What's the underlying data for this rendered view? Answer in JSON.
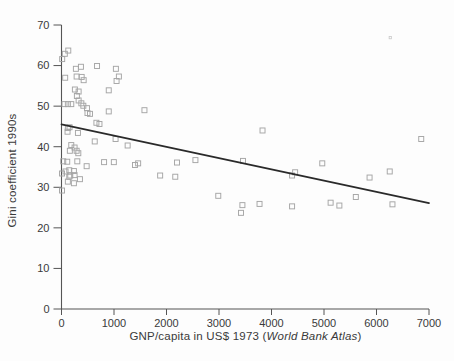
{
  "figure": {
    "background": "#fdfdfd",
    "marker_color": "#a5a5a5",
    "stray_mark_color": "#c8c8c8",
    "trend_line_color": "#2a2a2a",
    "axis_color": "#555555",
    "text_color": "#3a3a3a"
  },
  "chart_data": {
    "type": "scatter",
    "title": "",
    "xlabel_prefix": "GNP/capita in US$ 1973 (",
    "xlabel_italic": "World Bank Atlas",
    "xlabel_suffix": ")",
    "ylabel": "Gini coefficient 1990s",
    "xlim": [
      0,
      7000
    ],
    "ylim": [
      0,
      70
    ],
    "x_ticks": [
      0,
      1000,
      2000,
      3000,
      4000,
      5000,
      6000,
      7000
    ],
    "y_ticks": [
      0,
      10,
      20,
      30,
      40,
      50,
      60,
      70
    ],
    "grid": false,
    "legend": false,
    "marker": "open-square",
    "points": [
      [
        13,
        61.6
      ],
      [
        63,
        62.9
      ],
      [
        129,
        63.7
      ],
      [
        274,
        59.2
      ],
      [
        370,
        59.7
      ],
      [
        677,
        59.9
      ],
      [
        1036,
        59.2
      ],
      [
        70,
        57.0
      ],
      [
        288,
        57.3
      ],
      [
        384,
        57.2
      ],
      [
        422,
        56.4
      ],
      [
        1049,
        56.2
      ],
      [
        1093,
        57.3
      ],
      [
        255,
        54.1
      ],
      [
        326,
        53.6
      ],
      [
        900,
        53.9
      ],
      [
        293,
        52.5
      ],
      [
        57,
        50.5
      ],
      [
        121,
        50.5
      ],
      [
        186,
        50.5
      ],
      [
        326,
        51.4
      ],
      [
        378,
        50.7
      ],
      [
        416,
        50.1
      ],
      [
        485,
        49.5
      ],
      [
        495,
        48.3
      ],
      [
        543,
        48.1
      ],
      [
        900,
        48.7
      ],
      [
        1580,
        49.0
      ],
      [
        665,
        45.9
      ],
      [
        723,
        45.6
      ],
      [
        121,
        44.6
      ],
      [
        153,
        44.8
      ],
      [
        115,
        43.7
      ],
      [
        313,
        43.4
      ],
      [
        3829,
        44.0
      ],
      [
        633,
        41.3
      ],
      [
        1030,
        41.9
      ],
      [
        1260,
        40.3
      ],
      [
        186,
        40.4
      ],
      [
        249,
        39.8
      ],
      [
        159,
        39.0
      ],
      [
        288,
        39.0
      ],
      [
        320,
        38.4
      ],
      [
        6852,
        41.9
      ],
      [
        33,
        36.4
      ],
      [
        109,
        36.3
      ],
      [
        301,
        36.4
      ],
      [
        479,
        35.2
      ],
      [
        811,
        36.2
      ],
      [
        997,
        36.2
      ],
      [
        1400,
        35.5
      ],
      [
        1460,
        35.9
      ],
      [
        2200,
        36.1
      ],
      [
        2551,
        36.7
      ],
      [
        3457,
        36.5
      ],
      [
        4967,
        35.9
      ],
      [
        148,
        34.2
      ],
      [
        236,
        34.0
      ],
      [
        10,
        33.4
      ],
      [
        77,
        33.9
      ],
      [
        167,
        32.9
      ],
      [
        148,
        32.6
      ],
      [
        249,
        33.0
      ],
      [
        351,
        32.0
      ],
      [
        1879,
        32.9
      ],
      [
        2167,
        32.6
      ],
      [
        4392,
        32.9
      ],
      [
        4450,
        33.7
      ],
      [
        5868,
        32.4
      ],
      [
        6252,
        33.9
      ],
      [
        121,
        31.4
      ],
      [
        236,
        31.0
      ],
      [
        10,
        29.2
      ],
      [
        2986,
        27.9
      ],
      [
        3419,
        23.7
      ],
      [
        3446,
        25.6
      ],
      [
        3772,
        25.9
      ],
      [
        4392,
        25.3
      ],
      [
        5126,
        26.2
      ],
      [
        5293,
        25.5
      ],
      [
        5606,
        27.6
      ],
      [
        6304,
        25.8
      ]
    ],
    "trend_line": {
      "x1": 0,
      "y1": 45.5,
      "x2": 7000,
      "y2": 26.1
    },
    "stray_mark": [
      6260,
      66.9
    ]
  }
}
